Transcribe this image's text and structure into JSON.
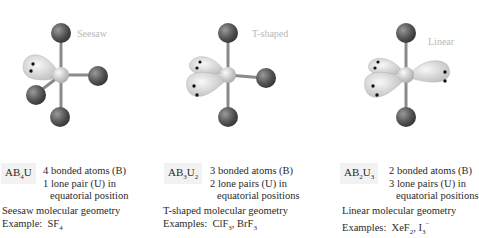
{
  "panels": [
    {
      "geometry_label": "Seesaw",
      "formula": {
        "base": "AB",
        "b_sub": "4",
        "u": "U",
        "u_sub": ""
      },
      "desc": [
        "4 bonded atoms (B)",
        "1 lone pair (U) in",
        "equatorial position"
      ],
      "caption": "Seesaw molecular geometry",
      "examples_label": "Example:",
      "examples": [
        {
          "t": "SF",
          "sub": "4",
          "sup": ""
        }
      ]
    },
    {
      "geometry_label": "T-shaped",
      "formula": {
        "base": "AB",
        "b_sub": "3",
        "u": "U",
        "u_sub": "2"
      },
      "desc": [
        "3 bonded atoms (B)",
        "2 lone pairs (U) in",
        "equatorial positions"
      ],
      "caption": "T-shaped molecular geometry",
      "examples_label": "Examples:",
      "examples": [
        {
          "t": "ClF",
          "sub": "3",
          "sup": ""
        },
        {
          "t": "BrF",
          "sub": "3",
          "sup": ""
        }
      ]
    },
    {
      "geometry_label": "Linear",
      "formula": {
        "base": "AB",
        "b_sub": "2",
        "u": "U",
        "u_sub": "3"
      },
      "desc": [
        "2 bonded atoms (B)",
        "3 lone pairs (U) in",
        "equatorial positions"
      ],
      "caption": "Linear molecular geometry",
      "examples_label": "Examples:",
      "examples": [
        {
          "t": "XeF",
          "sub": "2",
          "sup": ""
        },
        {
          "t": "I",
          "sub": "3",
          "sup": "−"
        }
      ]
    }
  ],
  "colors": {
    "atom": "#5a5a5a",
    "central_atom": "#d0d0d0",
    "lobe": "#e4e4e4",
    "bond": "#8a8a8a"
  }
}
